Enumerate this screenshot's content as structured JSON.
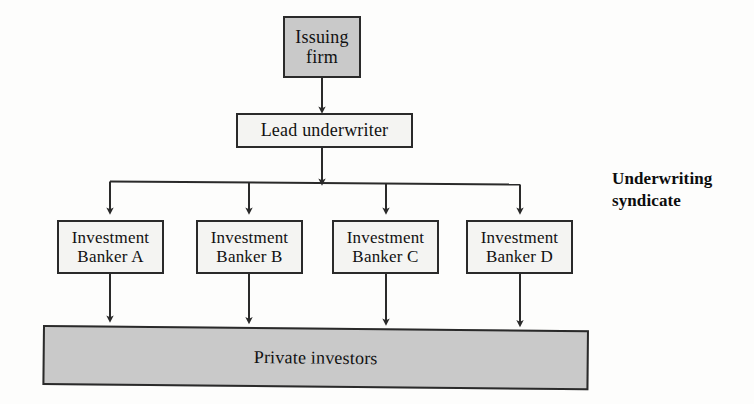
{
  "diagram": {
    "background_color": "#fdfdfc",
    "line_color": "#2a2a2a",
    "fill_gray": "#c9c9c9",
    "fill_white": "#f4f4f2",
    "nodes": {
      "issuing_firm": {
        "label": "Issuing\nfirm",
        "fill": "gray"
      },
      "lead_underwriter": {
        "label": "Lead underwriter",
        "fill": "white"
      },
      "bankers": [
        {
          "label": "Investment\nBanker A",
          "fill": "white"
        },
        {
          "label": "Investment\nBanker B",
          "fill": "white"
        },
        {
          "label": "Investment\nBanker C",
          "fill": "white"
        },
        {
          "label": "Investment\nBanker D",
          "fill": "white"
        }
      ],
      "private_investors": {
        "label": "Private investors",
        "fill": "gray"
      }
    },
    "annotations": {
      "syndicate": "Underwriting\nsyndicate"
    }
  }
}
